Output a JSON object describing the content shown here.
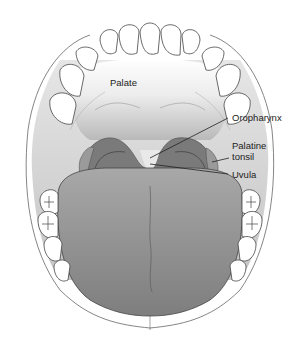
{
  "diagram": {
    "labels": {
      "palate": "Palate",
      "oropharynx": "Oropharynx",
      "palatine_tonsil_line1": "Palatine",
      "palatine_tonsil_line2": "tonsil",
      "uvula": "Uvula"
    },
    "colors": {
      "outline": "#555555",
      "tissue_light": "#f0f0f0",
      "tissue_mid": "#bdbdbd",
      "throat_dark": "#7a7a7a",
      "tongue": "#8c8c8c",
      "teeth": "#ffffff"
    }
  }
}
